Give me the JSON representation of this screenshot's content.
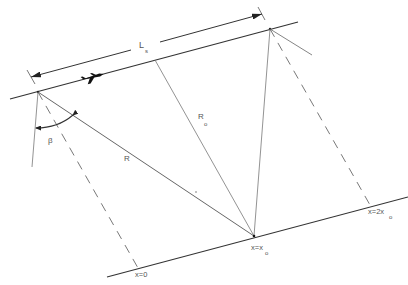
{
  "diagram": {
    "type": "side-looking radar / synthetic aperture geometry",
    "labels": {
      "synthetic_length": "L",
      "synthetic_length_sub": "s",
      "range": "R",
      "range_min": "R",
      "range_min_sub": "o",
      "angle": "β",
      "x_zero": "x=0",
      "x_center": "x=x",
      "x_center_sub": "o",
      "x_double": "x=2x",
      "x_double_sub": "o"
    },
    "colors": {
      "line": "#333333",
      "thin_line": "#666666",
      "text": "#555555",
      "background": "#ffffff"
    },
    "elements": {
      "flight_path": "upper solid line (aircraft track)",
      "ground_line": "lower solid line (ground track)",
      "aircraft_icon": "airplane-icon",
      "dimension": "double-headed arrow for synthetic aperture length"
    }
  }
}
